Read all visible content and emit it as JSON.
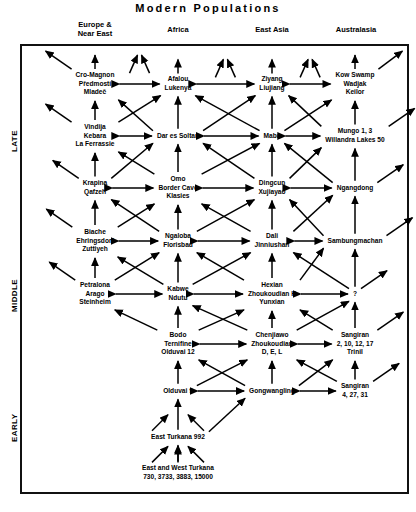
{
  "title": "Modern Populations",
  "columns": [
    {
      "id": "europe",
      "label_line1": "Europe &",
      "label_line2": "Near East",
      "x": 95
    },
    {
      "id": "africa",
      "label_line1": "Africa",
      "label_line2": "",
      "x": 178
    },
    {
      "id": "eastasia",
      "label_line1": "East Asia",
      "label_line2": "",
      "x": 272
    },
    {
      "id": "australasia",
      "label_line1": "Australasia",
      "label_line2": "",
      "x": 355
    }
  ],
  "eras": [
    {
      "id": "late",
      "label": "LATE"
    },
    {
      "id": "middle",
      "label": "MIDDLE"
    },
    {
      "id": "early",
      "label": "EARLY"
    }
  ],
  "rows": [
    {
      "id": "row-1",
      "nodes": [
        {
          "col": "europe",
          "lines": [
            "Cro-Magnon",
            "Předmostí",
            "Mladeč"
          ]
        },
        {
          "col": "africa",
          "lines": [
            "Afalou",
            "Lukenya"
          ]
        },
        {
          "col": "eastasia",
          "lines": [
            "Ziyang",
            "Liujiang"
          ]
        },
        {
          "col": "australasia",
          "lines": [
            "Kow Swamp",
            "Wadjak",
            "Keilor"
          ]
        }
      ]
    },
    {
      "id": "row-2",
      "nodes": [
        {
          "col": "europe",
          "lines": [
            "Vindija",
            "Kebara",
            "La Ferrassie"
          ]
        },
        {
          "col": "africa",
          "lines": [
            "Dar es Soltan"
          ]
        },
        {
          "col": "eastasia",
          "lines": [
            "Maba"
          ]
        },
        {
          "col": "australasia",
          "lines": [
            "Mungo 1, 3",
            "Willandra Lakes 50"
          ]
        }
      ]
    },
    {
      "id": "row-3",
      "nodes": [
        {
          "col": "europe",
          "lines": [
            "Krapina",
            "Qafzeh"
          ]
        },
        {
          "col": "africa",
          "lines": [
            "Omo",
            "Border Cave",
            "Klasies"
          ]
        },
        {
          "col": "eastasia",
          "lines": [
            "Dingcun",
            "Xujiayao"
          ]
        },
        {
          "col": "australasia",
          "lines": [
            "Ngangdong"
          ]
        }
      ]
    },
    {
      "id": "row-4",
      "nodes": [
        {
          "col": "europe",
          "lines": [
            "Biache",
            "Ehringsdorf",
            "Zuttiyeh"
          ]
        },
        {
          "col": "africa",
          "lines": [
            "Ngaloba",
            "Florisbad"
          ]
        },
        {
          "col": "eastasia",
          "lines": [
            "Dali",
            "Jinniushan"
          ]
        },
        {
          "col": "australasia",
          "lines": [
            "Sambungmachan"
          ]
        }
      ]
    },
    {
      "id": "row-5",
      "nodes": [
        {
          "col": "europe",
          "lines": [
            "Petralona",
            "Arago",
            "Steinheim"
          ]
        },
        {
          "col": "africa",
          "lines": [
            "Kabwe",
            "Ndutu"
          ]
        },
        {
          "col": "eastasia",
          "lines": [
            "Hexian",
            "Zhoukoudian H",
            "Yunxian"
          ]
        },
        {
          "col": "australasia",
          "lines": [
            "?"
          ]
        }
      ]
    },
    {
      "id": "row-6",
      "nodes": [
        {
          "col": "africa",
          "lines": [
            "Bodo",
            "Ternifine",
            "Olduvai 12"
          ]
        },
        {
          "col": "eastasia",
          "lines": [
            "Chenjiawo",
            "Zhoukoudian",
            "D, E, L"
          ]
        },
        {
          "col": "australasia",
          "lines": [
            "Sangiran",
            "2, 10, 12, 17",
            "Trinil"
          ]
        }
      ]
    },
    {
      "id": "row-7",
      "nodes": [
        {
          "col": "africa",
          "lines": [
            "Olduvai 9"
          ]
        },
        {
          "col": "eastasia",
          "lines": [
            "Gongwangling"
          ]
        },
        {
          "col": "australasia",
          "lines": [
            "Sangiran",
            "4, 27, 31"
          ]
        }
      ]
    },
    {
      "id": "row-8",
      "nodes": [
        {
          "col": "africa",
          "lines": [
            "East Turkana  992"
          ]
        }
      ]
    },
    {
      "id": "row-9",
      "nodes": [
        {
          "col": "africa",
          "lines": [
            "East and West Turkana",
            "730, 3733, 3883, 15000"
          ]
        }
      ]
    }
  ],
  "chart_data": {
    "type": "diagram",
    "title": "Modern Populations",
    "subtype": "multiregional-evolution-lattice",
    "xlabel": "",
    "ylabel": "",
    "regions": [
      "Europe & Near East",
      "Africa",
      "East Asia",
      "Australasia"
    ],
    "time_axis": [
      "LATE",
      "MIDDLE",
      "EARLY"
    ],
    "grid": false,
    "legend": "none",
    "levels": [
      {
        "level": 1,
        "era": "LATE",
        "entries": {
          "Europe & Near East": [
            "Cro-Magnon",
            "Předmostí",
            "Mladeč"
          ],
          "Africa": [
            "Afalou",
            "Lukenya"
          ],
          "East Asia": [
            "Ziyang",
            "Liujiang"
          ],
          "Australasia": [
            "Kow Swamp",
            "Wadjak",
            "Keilor"
          ]
        }
      },
      {
        "level": 2,
        "era": "LATE",
        "entries": {
          "Europe & Near East": [
            "Vindija",
            "Kebara",
            "La Ferrassie"
          ],
          "Africa": [
            "Dar es Soltan"
          ],
          "East Asia": [
            "Maba"
          ],
          "Australasia": [
            "Mungo 1, 3",
            "Willandra Lakes 50"
          ]
        }
      },
      {
        "level": 3,
        "era": "LATE",
        "entries": {
          "Europe & Near East": [
            "Krapina",
            "Qafzeh"
          ],
          "Africa": [
            "Omo",
            "Border Cave",
            "Klasies"
          ],
          "East Asia": [
            "Dingcun",
            "Xujiayao"
          ],
          "Australasia": [
            "Ngangdong"
          ]
        }
      },
      {
        "level": 4,
        "era": "MIDDLE",
        "entries": {
          "Europe & Near East": [
            "Biache",
            "Ehringsdorf",
            "Zuttiyeh"
          ],
          "Africa": [
            "Ngaloba",
            "Florisbad"
          ],
          "East Asia": [
            "Dali",
            "Jinniushan"
          ],
          "Australasia": [
            "Sambungmachan"
          ]
        }
      },
      {
        "level": 5,
        "era": "MIDDLE",
        "entries": {
          "Europe & Near East": [
            "Petralona",
            "Arago",
            "Steinheim"
          ],
          "Africa": [
            "Kabwe",
            "Ndutu"
          ],
          "East Asia": [
            "Hexian",
            "Zhoukoudian H",
            "Yunxian"
          ],
          "Australasia": [
            "?"
          ]
        }
      },
      {
        "level": 6,
        "era": "EARLY",
        "entries": {
          "Africa": [
            "Bodo",
            "Ternifine",
            "Olduvai 12"
          ],
          "East Asia": [
            "Chenjiawo",
            "Zhoukoudian",
            "D, E, L"
          ],
          "Australasia": [
            "Sangiran",
            "2, 10, 12, 17",
            "Trinil"
          ]
        }
      },
      {
        "level": 7,
        "era": "EARLY",
        "entries": {
          "Africa": [
            "Olduvai 9"
          ],
          "East Asia": [
            "Gongwangling"
          ],
          "Australasia": [
            "Sangiran",
            "4, 27, 31"
          ]
        }
      },
      {
        "level": 8,
        "era": "EARLY",
        "entries": {
          "Africa": [
            "East Turkana  992"
          ]
        }
      },
      {
        "level": 9,
        "era": "EARLY",
        "entries": {
          "Africa": [
            "East and West Turkana",
            "730, 3733, 3883, 15000"
          ]
        }
      }
    ],
    "edge_types": [
      "vertical-ancestry-arrow",
      "diagonal-gene-flow-arrow",
      "horizontal-bidirectional-gene-flow-arrow"
    ]
  }
}
